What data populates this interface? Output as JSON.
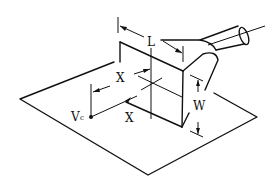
{
  "figure": {
    "labels": {
      "length": "L",
      "width": "W",
      "distance_upper": "X",
      "distance_lower": "X",
      "point": "V",
      "point_sub": "c"
    },
    "colors": {
      "line": "#111111",
      "background": "#ffffff"
    }
  }
}
